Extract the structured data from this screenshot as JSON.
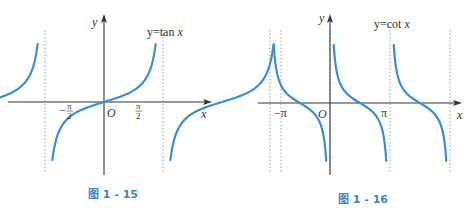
{
  "chart_data": [
    {
      "type": "line",
      "title": "y=tan x",
      "caption": "图 1 - 15",
      "function": "tan",
      "xlabel": "x",
      "ylabel": "y",
      "origin_label": "O",
      "x_ticks": [
        {
          "value": -1.5708,
          "label_num": "π",
          "label_den": "2",
          "sign": "−"
        },
        {
          "value": 1.5708,
          "label_num": "π",
          "label_den": "2",
          "sign": ""
        }
      ],
      "asymptotes": [
        -4.7124,
        -1.5708,
        1.5708,
        4.7124
      ],
      "branches": [
        {
          "x_from": -4.7124,
          "x_to": -1.5708,
          "zero_at": -3.1416
        },
        {
          "x_from": -1.5708,
          "x_to": 1.5708,
          "zero_at": 0
        },
        {
          "x_from": 1.5708,
          "x_to": 4.7124,
          "zero_at": 3.1416
        }
      ],
      "grid": false,
      "line_color": "#3a8fd0"
    },
    {
      "type": "line",
      "title": "y=cot x",
      "caption": "图 1 - 16",
      "function": "cot",
      "xlabel": "x",
      "ylabel": "y",
      "origin_label": "O",
      "x_ticks": [
        {
          "value": -3.1416,
          "label": "−π"
        },
        {
          "value": 3.1416,
          "label": "π"
        }
      ],
      "asymptotes": [
        -3.1416,
        0,
        3.1416,
        6.2832
      ],
      "branches": [
        {
          "x_from": -3.1416,
          "x_to": 0,
          "zero_at": -1.5708
        },
        {
          "x_from": 0,
          "x_to": 3.1416,
          "zero_at": 1.5708
        },
        {
          "x_from": 3.1416,
          "x_to": 6.2832,
          "zero_at": 4.7124
        }
      ],
      "grid": false,
      "line_color": "#3a8fd0"
    }
  ],
  "figures": {
    "tan": {
      "func_label": "y=tan",
      "func_var": "x",
      "y_axis_label": "y",
      "x_axis_label": "x",
      "origin": "O",
      "tick_neg": "−",
      "tick_frac_num": "π",
      "tick_frac_den": "2",
      "caption": "图 1 - 15"
    },
    "cot": {
      "func_label": "y=cot",
      "func_var": "x",
      "y_axis_label": "y",
      "x_axis_label": "x",
      "origin": "O",
      "tick_neg": "−π",
      "tick_pos": "π",
      "caption": "图 1 - 16"
    }
  }
}
